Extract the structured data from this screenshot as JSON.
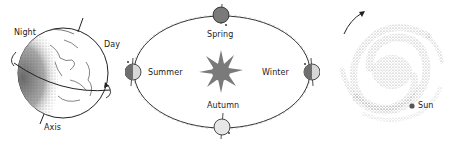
{
  "earth_panel": {
    "labels": {
      "night": "Night",
      "day": "Day",
      "axis": "Axis"
    }
  },
  "orbit_panel": {
    "center": "sun-icon",
    "seasons": {
      "spring": "Spring",
      "summer": "Summer",
      "autumn": "Autumn",
      "winter": "Winter"
    }
  },
  "galaxy_panel": {
    "labels": {
      "sun": "Sun"
    }
  },
  "colors": {
    "ink": "#222222",
    "sun_fill": "#7a7a7a",
    "planet_dark": "#777777",
    "planet_light": "#d8d8d8",
    "galaxy_dots": "#9a9a9a"
  }
}
